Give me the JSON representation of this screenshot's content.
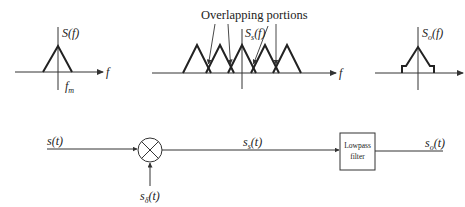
{
  "plots": {
    "original": {
      "ylabel": "S(f)",
      "xlabel": "f",
      "tick_label": "f",
      "tick_sub": "m"
    },
    "sampled": {
      "ylabel_main": "S",
      "ylabel_sub": "s",
      "ylabel_tail": "(f)",
      "xlabel": "f",
      "annotation": "Overlapping portions",
      "num_replicas": 5,
      "num_overlap_arrows": 4
    },
    "output": {
      "ylabel_main": "S",
      "ylabel_sub": "o",
      "ylabel_tail": "(f)"
    }
  },
  "block_diagram": {
    "input_label_main": "s(t)",
    "sampling_label_main": "s",
    "sampling_label_sub": "δ",
    "sampling_label_tail": "(t)",
    "mixer_symbol": "multiplier",
    "sampled_label_main": "s",
    "sampled_label_sub": "s",
    "sampled_label_tail": "(t)",
    "filter_line1": "Lowpass",
    "filter_line2": "filter",
    "output_label_main": "s",
    "output_label_sub": "o",
    "output_label_tail": "(t)"
  }
}
